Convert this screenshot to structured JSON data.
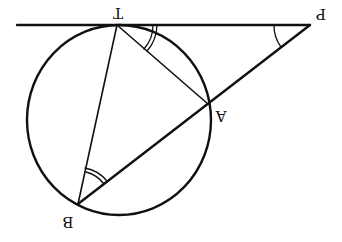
{
  "diagram": {
    "orientation": "rotated 180 degrees",
    "stroke_color": "#111111",
    "background": "#ffffff",
    "points": {
      "T": {
        "label": "T",
        "x": 117,
        "y": 25
      },
      "P": {
        "label": "P",
        "x": 310,
        "y": 25
      },
      "A": {
        "label": "A",
        "x": 208,
        "y": 104
      },
      "B": {
        "label": "B",
        "x": 78,
        "y": 204
      }
    },
    "circle": {
      "cx": 119,
      "cy": 120,
      "rx": 92,
      "ry": 95
    },
    "segments": [
      "tangent line through T and P",
      "TB",
      "TA",
      "PB (secant through A)"
    ],
    "angle_marks": [
      {
        "at": "T",
        "between": "TP and TA",
        "arcs": 2
      },
      {
        "at": "B",
        "between": "BT and BA",
        "arcs": 2
      },
      {
        "at": "P",
        "between": "PT and PA",
        "arcs": 1
      }
    ]
  }
}
